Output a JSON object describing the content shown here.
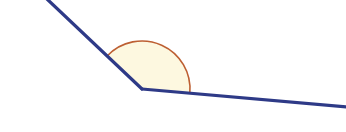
{
  "figure": {
    "type": "geometry-diagram",
    "canvas": {
      "width": 346,
      "height": 132,
      "background": "#ffffff"
    },
    "colors": {
      "ray_stroke": "#2e3a87",
      "arc_stroke": "#bd5f32",
      "arc_fill": "#fdf8e0",
      "background": "#ffffff"
    },
    "vertex": {
      "label": "vertex",
      "x": 142,
      "y": 89
    },
    "rays": [
      {
        "name": "upper-left-ray",
        "from_x": 142,
        "from_y": 89,
        "to_x": 47,
        "to_y": -1,
        "stroke_width": 3.2,
        "angle_deg": 136.6
      },
      {
        "name": "right-ray",
        "from_x": 142,
        "from_y": 89,
        "to_x": 347,
        "to_y": 107,
        "stroke_width": 3.2,
        "angle_deg": -5.0
      }
    ],
    "arc": {
      "name": "angle-arc",
      "center_x": 142,
      "center_y": 89,
      "radius": 48,
      "start_angle_deg": -5.0,
      "end_angle_deg": 136.6,
      "sweep_deg": 141.6,
      "stroke_width": 1.6,
      "path": "M 189.8 84.8 A 48 48 0 0 0 107.1 56.0 L 142 89 Z",
      "arc_only_path": "M 189.8 84.8 A 48 48 0 0 0 107.1 56.0"
    },
    "labels": []
  }
}
